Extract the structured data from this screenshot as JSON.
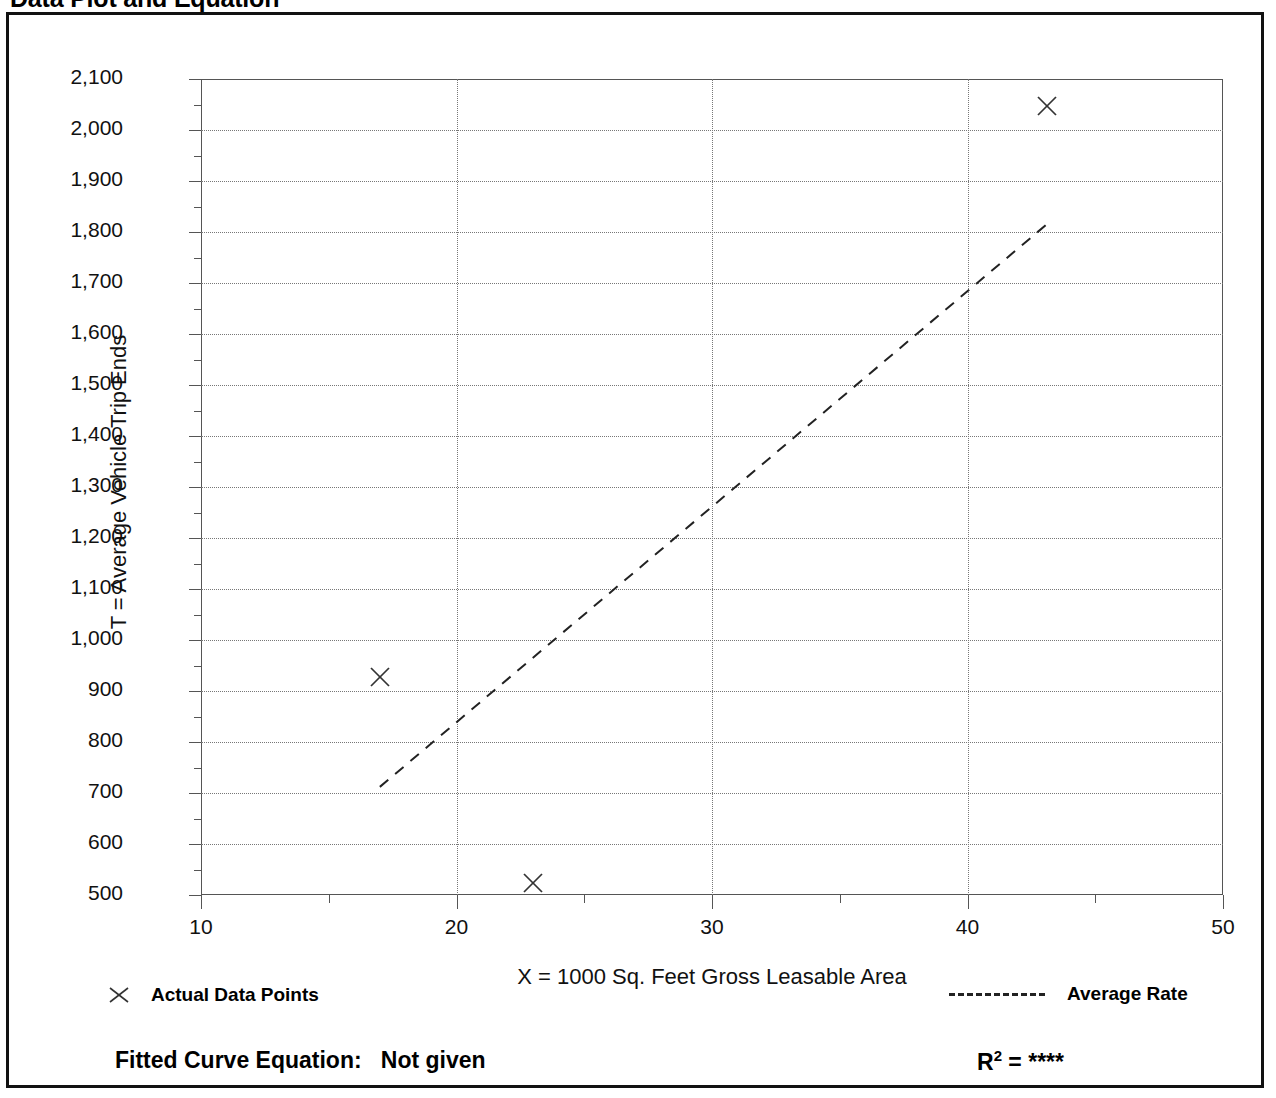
{
  "page": {
    "title": "Data Plot and Equation",
    "title_right": ""
  },
  "chart_data": {
    "type": "scatter",
    "title": "Data Plot and Equation",
    "xlabel": "X = 1000 Sq. Feet Gross Leasable Area",
    "ylabel": "T = Average Vehicle Trip Ends",
    "xlim": [
      10,
      50
    ],
    "ylim": [
      500,
      2100
    ],
    "xticks": [
      10,
      20,
      30,
      40,
      50
    ],
    "xtick_labels": [
      "10",
      "20",
      "30",
      "40",
      "50"
    ],
    "xtick_minor_step": 5,
    "yticks": [
      500,
      600,
      700,
      800,
      900,
      1000,
      1100,
      1200,
      1300,
      1400,
      1500,
      1600,
      1700,
      1800,
      1900,
      2000,
      2100
    ],
    "ytick_labels": [
      "500",
      "600",
      "700",
      "800",
      "900",
      "1,000",
      "1,100",
      "1,200",
      "1,300",
      "1,400",
      "1,500",
      "1,600",
      "1,700",
      "1,800",
      "1,900",
      "2,000",
      "2,100"
    ],
    "ytick_minor_step": 50,
    "grid": true,
    "grid_style": "dotted",
    "series": [
      {
        "name": "Actual Data Points",
        "marker": "x",
        "points": [
          {
            "x": 17.0,
            "y": 928
          },
          {
            "x": 23.0,
            "y": 524
          },
          {
            "x": 43.1,
            "y": 2048
          }
        ]
      },
      {
        "name": "Average Rate",
        "style": "dashed-line",
        "points": [
          {
            "x": 17.0,
            "y": 712
          },
          {
            "x": 43.1,
            "y": 1815
          }
        ]
      }
    ],
    "legend": [
      {
        "marker": "x",
        "label": "Actual Data Points"
      },
      {
        "marker": "dashed-line",
        "label": "Average Rate"
      }
    ],
    "annotations": {
      "fitted_curve_label": "Fitted Curve Equation:",
      "fitted_curve_value": "Not given",
      "r_squared_label": "R",
      "r_squared_exponent": "2",
      "r_squared_equals": " = ",
      "r_squared_value": "****"
    }
  }
}
